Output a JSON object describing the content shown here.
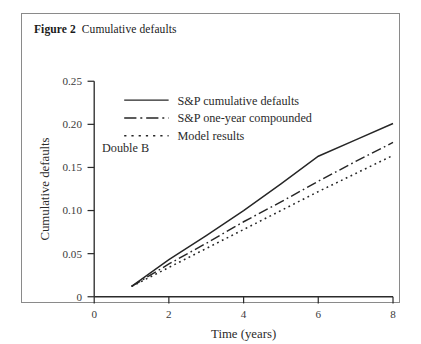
{
  "figure": {
    "label": "Figure 2",
    "caption": "Cumulative defaults"
  },
  "chart_data": {
    "type": "line",
    "title": "Cumulative defaults",
    "xlabel": "Time (years)",
    "ylabel": "Cumulative defaults",
    "xlim": [
      0,
      8
    ],
    "ylim": [
      0,
      0.25
    ],
    "xticks": [
      "0",
      "2",
      "4",
      "6",
      "8"
    ],
    "xtick_values": [
      0,
      2,
      4,
      6,
      8
    ],
    "yticks": [
      "0",
      "0.05",
      "0.10",
      "0.15",
      "0.20",
      "0.25"
    ],
    "ytick_values": [
      0,
      0.05,
      0.1,
      0.15,
      0.2,
      0.25
    ],
    "grid": false,
    "legend_position": "upper-left",
    "annotations": [
      {
        "text": "Double B",
        "x": 1.6,
        "y": 0.125
      }
    ],
    "x": [
      1,
      2,
      3,
      4,
      5,
      6,
      7,
      8
    ],
    "series": [
      {
        "name": "S&P cumulative defaults",
        "style": "solid",
        "values": [
          0.012,
          0.043,
          0.071,
          0.1,
          0.131,
          0.163,
          0.182,
          0.201
        ]
      },
      {
        "name": "S&P one-year compounded",
        "style": "dash-dot",
        "values": [
          0.012,
          0.038,
          0.062,
          0.087,
          0.11,
          0.134,
          0.157,
          0.179
        ]
      },
      {
        "name": "Model results",
        "style": "dotted",
        "values": [
          0.012,
          0.034,
          0.056,
          0.078,
          0.1,
          0.122,
          0.143,
          0.164
        ]
      }
    ]
  },
  "legend": {
    "entries": [
      {
        "label": "S&P cumulative defaults",
        "style": "solid"
      },
      {
        "label": "S&P one-year compounded",
        "style": "dash-dot"
      },
      {
        "label": "Model results",
        "style": "dotted"
      }
    ]
  }
}
